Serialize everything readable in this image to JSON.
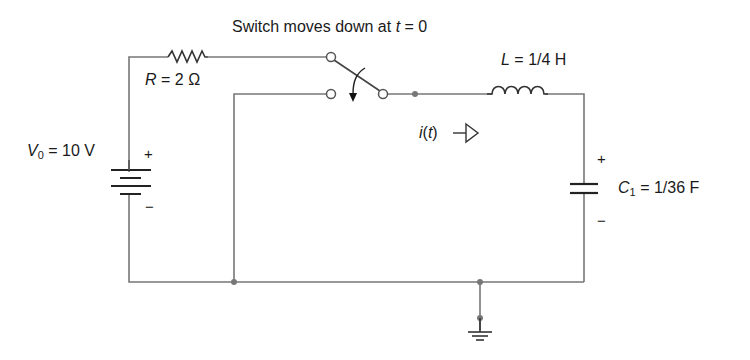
{
  "title": {
    "prefix": "Switch moves down at ",
    "var": "t",
    "suffix": " = 0"
  },
  "components": {
    "resistor": {
      "symbol": "R",
      "value": " = 2 Ω"
    },
    "source": {
      "symbol": "V",
      "subscript": "0",
      "value": " = 10 V",
      "plus": "+",
      "minus": "−"
    },
    "inductor": {
      "symbol": "L",
      "value": " = 1/4 H"
    },
    "capacitor": {
      "symbol": "C",
      "subscript": "1",
      "value": " = 1/36 F",
      "plus": "+",
      "minus": "−"
    },
    "current": {
      "label_var": "i",
      "label_paren_open": "(",
      "label_arg": "t",
      "label_paren_close": ")"
    }
  },
  "colors": {
    "wire": "#777777",
    "symbol": "#222222",
    "node": "#777777"
  }
}
